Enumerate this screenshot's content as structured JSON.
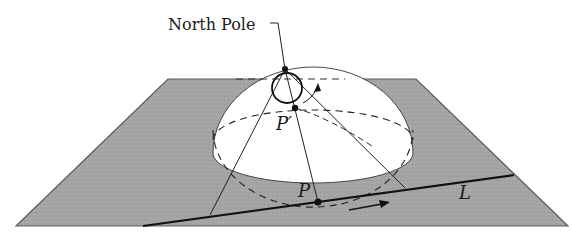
{
  "figure": {
    "labels": {
      "north_pole": "North Pole",
      "p_prime": "P′",
      "p": "P",
      "line": "L"
    },
    "colors": {
      "plane_fill": "#a4a4a4",
      "plane_edge": "#5a5a5a",
      "sphere_fill": "#ffffff",
      "ink": "#1a1a1a"
    },
    "elements": [
      {
        "name": "plane",
        "type": "parallelogram",
        "corners": [
          [
            16,
            226
          ],
          [
            168,
            79
          ],
          [
            416,
            79
          ],
          [
            568,
            226
          ]
        ]
      },
      {
        "name": "hemisphere",
        "type": "upper-hemisphere",
        "center": [
          313,
          153
        ],
        "rx": 100,
        "ry": 30
      },
      {
        "name": "north-pole-point",
        "type": "point",
        "at": [
          285,
          69
        ]
      },
      {
        "name": "small-circle",
        "type": "circle-through-north-pole",
        "center": [
          287,
          88
        ],
        "r": 15
      },
      {
        "name": "p-prime-point",
        "type": "point",
        "at": [
          295,
          108
        ]
      },
      {
        "name": "line-L",
        "type": "line",
        "from": [
          143,
          226
        ],
        "to": [
          514,
          175
        ]
      },
      {
        "name": "p-point",
        "type": "point",
        "at": [
          318,
          202
        ]
      },
      {
        "name": "direction-arrow-L",
        "type": "arrow",
        "from": [
          349,
          210
        ],
        "to": [
          388,
          203
        ]
      },
      {
        "name": "direction-arrow-circle",
        "type": "arrow",
        "from": [
          311,
          102
        ],
        "to": [
          318,
          86
        ]
      }
    ]
  }
}
